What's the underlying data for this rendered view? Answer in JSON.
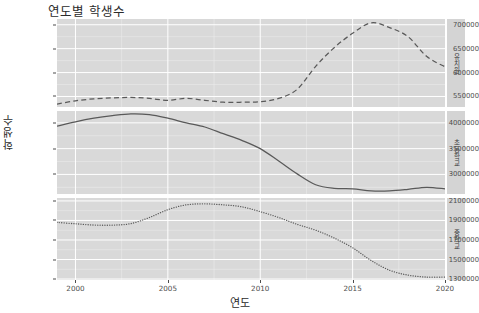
{
  "chart_data": {
    "type": "line",
    "title": "연도별 학생수",
    "xlabel": "연도",
    "ylabel": "학생수",
    "grid": true,
    "legend_position": "none",
    "facet_position": "right",
    "x": [
      1999,
      2000,
      2001,
      2002,
      2003,
      2004,
      2005,
      2006,
      2007,
      2008,
      2009,
      2010,
      2011,
      2012,
      2013,
      2014,
      2015,
      2016,
      2017,
      2018,
      2019,
      2020
    ],
    "xlim": [
      1999,
      2020
    ],
    "xticks": [
      2000,
      2005,
      2010,
      2015,
      2020
    ],
    "xticklabels": [
      "2000",
      "2005",
      "2010",
      "2015",
      "2020"
    ],
    "facets": [
      {
        "label": "유치원",
        "linetype": "dashed",
        "color": "#595959",
        "ylim": [
          528000,
          712000
        ],
        "yticks": [
          550000,
          600000,
          650000,
          700000
        ],
        "yticklabels": [
          "550000",
          "600000",
          "650000",
          "700000"
        ],
        "values": [
          534000,
          541000,
          545000,
          547000,
          548000,
          546000,
          542000,
          546000,
          542000,
          538000,
          538000,
          539000,
          546000,
          565000,
          613000,
          652000,
          682000,
          704000,
          694000,
          675000,
          634000,
          612000
        ]
      },
      {
        "label": "초등학교",
        "linetype": "solid",
        "color": "#595959",
        "ylim": [
          2620000,
          4230000
        ],
        "yticks": [
          3000000,
          3500000,
          4000000
        ],
        "yticklabels": [
          "3000000",
          "3500000",
          "4000000"
        ],
        "values": [
          3935000,
          4020000,
          4090000,
          4140000,
          4175000,
          4160000,
          4090000,
          4000000,
          3920000,
          3790000,
          3660000,
          3500000,
          3260000,
          3010000,
          2800000,
          2730000,
          2720000,
          2680000,
          2680000,
          2710000,
          2750000,
          2720000
        ]
      },
      {
        "label": "중학교",
        "linetype": "dotted",
        "color": "#595959",
        "ylim": [
          1290000,
          2130000
        ],
        "yticks": [
          1300000,
          1500000,
          1700000,
          1900000,
          2100000
        ],
        "yticklabels": [
          "1300000",
          "1500000",
          "1700000",
          "1900000",
          "2100000"
        ],
        "values": [
          1880000,
          1866000,
          1853000,
          1852000,
          1868000,
          1930000,
          2010000,
          2060000,
          2070000,
          2060000,
          2040000,
          1990000,
          1930000,
          1860000,
          1800000,
          1720000,
          1620000,
          1490000,
          1390000,
          1340000,
          1320000,
          1320000
        ]
      }
    ]
  },
  "axis": {
    "y_title": "학생수",
    "x_title": "연도"
  }
}
